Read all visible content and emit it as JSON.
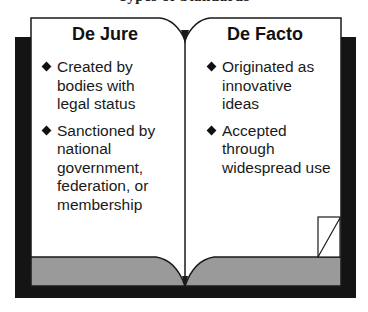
{
  "title": "Types of Standards",
  "colors": {
    "page": "#ffffff",
    "outline": "#1a1a1a",
    "backing": "#141414",
    "page_edge_band": "#9a9a9a"
  },
  "left_page": {
    "heading": "De Jure",
    "bullets": [
      {
        "icon": "diamond-bullet-icon",
        "text": "Created by\nbodies with\nlegal status"
      },
      {
        "icon": "diamond-bullet-icon",
        "text": "Sanctioned by\nnational\ngovernment,\nfederation, or\nmembership"
      }
    ]
  },
  "right_page": {
    "heading": "De Facto",
    "bullets": [
      {
        "icon": "diamond-bullet-icon",
        "text": "Originated as\ninnovative\nideas"
      },
      {
        "icon": "diamond-bullet-icon",
        "text": "Accepted\nthrough\nwidespread use"
      }
    ],
    "corner_icon": "folded-page-corner-icon"
  }
}
